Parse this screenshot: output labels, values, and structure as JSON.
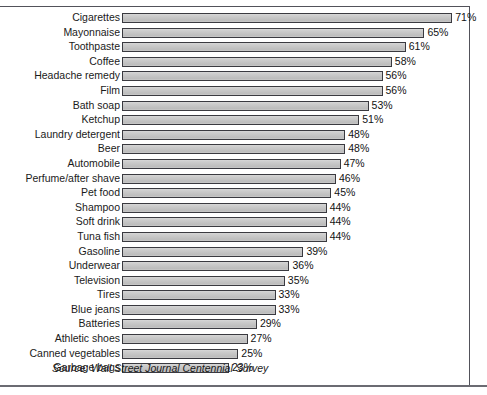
{
  "chart_data": {
    "type": "bar",
    "orientation": "horizontal",
    "title": "",
    "xlabel": "",
    "ylabel": "",
    "xlim": [
      0,
      75
    ],
    "grid": false,
    "legend": null,
    "value_suffix": "%",
    "categories": [
      "Cigarettes",
      "Mayonnaise",
      "Toothpaste",
      "Coffee",
      "Headache remedy",
      "Film",
      "Bath soap",
      "Ketchup",
      "Laundry detergent",
      "Beer",
      "Automobile",
      "Perfume/after shave",
      "Pet food",
      "Shampoo",
      "Soft drink",
      "Tuna fish",
      "Gasoline",
      "Underwear",
      "Television",
      "Tires",
      "Blue jeans",
      "Batteries",
      "Athletic shoes",
      "Canned vegetables",
      "Garbage bags"
    ],
    "values": [
      71,
      65,
      61,
      58,
      56,
      56,
      53,
      51,
      48,
      48,
      47,
      46,
      45,
      44,
      44,
      44,
      39,
      36,
      35,
      33,
      33,
      29,
      27,
      25,
      23
    ],
    "data_labels": [
      "71%",
      "65%",
      "61%",
      "58%",
      "56%",
      "56%",
      "53%",
      "51%",
      "48%",
      "48%",
      "47%",
      "46%",
      "45%",
      "44%",
      "44%",
      "44%",
      "39%",
      "36%",
      "35%",
      "33%",
      "33%",
      "29%",
      "27%",
      "25%",
      "23%"
    ],
    "source": "Source: Wall Street Journal Centennial Survey",
    "colors": {
      "bar_fill": "#c8c8c8",
      "bar_border": "#3a3a40",
      "frame": "#52525a",
      "text": "#1a1a1a",
      "background": "#ffffff"
    }
  }
}
